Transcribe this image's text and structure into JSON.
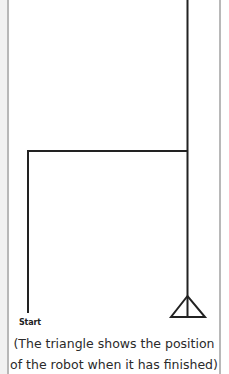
{
  "diagram": {
    "type": "robot-path",
    "labels": {
      "start": "Start"
    },
    "caption": {
      "line1": "(The triangle shows the position",
      "line2": "of the robot when it has finished)"
    },
    "colors": {
      "path": "#222222",
      "border": "#b8b8b8",
      "text": "#2a2a2a"
    },
    "path_segments": [
      {
        "from": "start",
        "direction": "up"
      },
      {
        "direction": "right"
      },
      {
        "direction": "up",
        "note": "continues off top edge"
      },
      {
        "direction": "down",
        "note": "returns to finish position at triangle"
      }
    ],
    "end_marker": "triangle"
  }
}
